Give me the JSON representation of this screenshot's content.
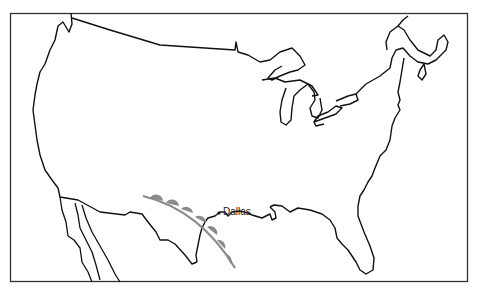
{
  "map": {
    "type": "weather-front-map",
    "region": "Contiguous United States",
    "front": {
      "kind": "warm-front",
      "symbol": "semicircles",
      "color": "#8a8a8a",
      "semicircle_count": 7
    },
    "cities": [
      {
        "name": "Dallas",
        "label": "Dallas"
      }
    ],
    "colors": {
      "outline": "#111111",
      "frame": "#333333",
      "background": "#ffffff"
    }
  }
}
